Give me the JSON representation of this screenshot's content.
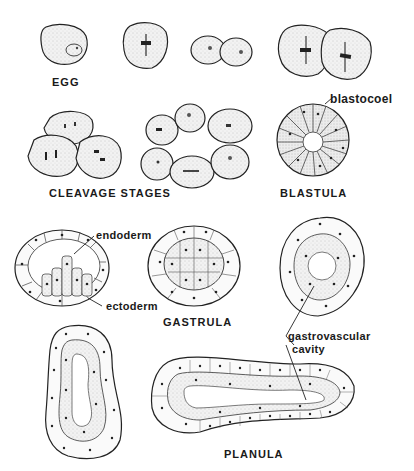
{
  "figure": {
    "stages": {
      "egg": "EGG",
      "cleavage": "CLEAVAGE STAGES",
      "blastula": "BLASTULA",
      "gastrula": "GASTRULA",
      "planula": "PLANULA"
    },
    "annotations": {
      "blastocoel": "blastocoel",
      "endoderm": "endoderm",
      "ectoderm": "ectoderm",
      "gastrovascular_line1": "gastrovascular",
      "gastrovascular_line2": "cavity"
    },
    "colors": {
      "ink": "#1a1a1a",
      "stipple": "#e6e6e6",
      "background": "#ffffff"
    }
  }
}
